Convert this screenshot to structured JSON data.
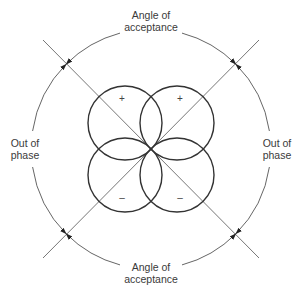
{
  "diagram": {
    "labels": {
      "top": [
        "Angle of",
        "acceptance"
      ],
      "bottom": [
        "Angle of",
        "acceptance"
      ],
      "left": [
        "Out of",
        "phase"
      ],
      "right": [
        "Out of",
        "phase"
      ]
    },
    "lobe_signs": {
      "top_left": "+",
      "top_right": "+",
      "bottom_left": "–",
      "bottom_right": "–"
    },
    "colors": {
      "lobe_stroke": "#333333",
      "arc_stroke": "#666666",
      "diagonal_stroke": "#777777",
      "text": "#3a3a3a",
      "background": "#ffffff"
    },
    "geometry": {
      "center": [
        151,
        149
      ],
      "outer_radius": 120,
      "lobe_radius": 37,
      "lobe_offset": 26
    }
  }
}
